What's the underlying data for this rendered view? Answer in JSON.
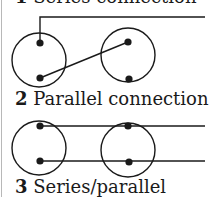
{
  "diagram": {
    "colors": {
      "line": "#1a1a1a",
      "background": "#ffffff",
      "edge": "#b8b8b8"
    },
    "captions": [
      {
        "number": "1",
        "label": "Series connection"
      },
      {
        "number": "2",
        "label": "Parallel connection"
      },
      {
        "number": "3",
        "label": "Series/parallel"
      }
    ],
    "figures": [
      {
        "name": "series-connection",
        "cells": [
          {
            "cx": 39,
            "cy": 60,
            "r": 27,
            "terminals": [
              [
                40,
                43
              ],
              [
                40,
                78
              ]
            ]
          },
          {
            "cx": 128,
            "cy": 55,
            "r": 27,
            "terminals": [
              [
                128,
                42
              ],
              [
                129,
                79
              ]
            ]
          }
        ]
      },
      {
        "name": "parallel-connection",
        "cells": [
          {
            "cx": 39,
            "cy": 148,
            "r": 27,
            "terminals": [
              [
                40,
                126
              ],
              [
                40,
                161
              ]
            ]
          },
          {
            "cx": 128,
            "cy": 150,
            "r": 27,
            "terminals": [
              [
                128,
                126
              ],
              [
                129,
                162
              ]
            ]
          }
        ]
      }
    ]
  }
}
